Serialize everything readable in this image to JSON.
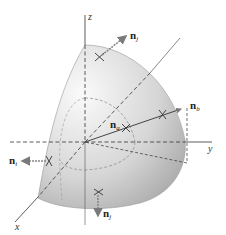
{
  "diagram": {
    "axes": {
      "x_label": "x",
      "y_label": "y",
      "z_label": "z"
    },
    "vectors": [
      {
        "id": "n_j_top",
        "symbol": "n",
        "subscript": "j",
        "direction": "outward normal, top of surface"
      },
      {
        "id": "n_b",
        "symbol": "n",
        "subscript": "b",
        "direction": "outward normal, right side of surface"
      },
      {
        "id": "n_a",
        "symbol": "n",
        "subscript": "a",
        "direction": "inner point along radial line"
      },
      {
        "id": "n_i_left",
        "symbol": "n",
        "subscript": "i",
        "direction": "normal pointing in -x/left"
      },
      {
        "id": "n_j_bottom",
        "symbol": "n",
        "subscript": "j",
        "direction": "normal pointing down"
      }
    ],
    "colors": {
      "surface_light": "#f4f4f4",
      "surface_dark": "#b8b8b8",
      "arrow": "#777777",
      "line": "#333333"
    }
  }
}
